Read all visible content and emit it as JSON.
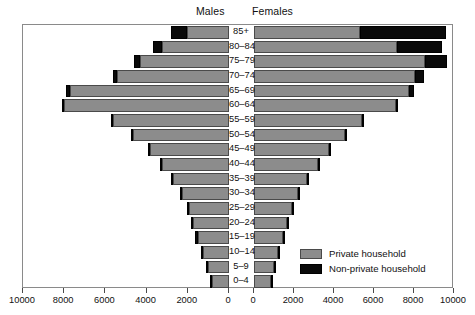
{
  "panels": {
    "left_label": "Males",
    "right_label": "Females"
  },
  "legend": {
    "items": [
      {
        "label": "Private household",
        "color": "#8c8c8c",
        "key": "private"
      },
      {
        "label": "Non-private household",
        "color": "#0a0a0a",
        "key": "nonprivate"
      }
    ]
  },
  "axis": {
    "tick_labels_left": [
      "10000",
      "8000",
      "6000",
      "4000",
      "2000",
      "0"
    ],
    "tick_labels_right": [
      "0",
      "2000",
      "4000",
      "6000",
      "8000",
      "10000"
    ],
    "tick_values": [
      0,
      2000,
      4000,
      6000,
      8000,
      10000
    ],
    "max": 10000
  },
  "chart_data": {
    "type": "bar",
    "subtype": "population-pyramid",
    "title": "",
    "xlabel": "",
    "ylabel": "",
    "xlim": [
      0,
      10000
    ],
    "grid": false,
    "legend_position": "bottom-right",
    "orientation": "horizontal",
    "stacked": true,
    "categories": [
      "85+",
      "80–84",
      "75–79",
      "70–74",
      "65–69",
      "60–64",
      "55–59",
      "50–54",
      "45–49",
      "40–44",
      "35–39",
      "30–34",
      "25–29",
      "20–24",
      "15–19",
      "10–14",
      "5–9",
      "0–4"
    ],
    "series": [
      {
        "name": "Males - Private household",
        "side": "left",
        "stack_key": "private",
        "color": "#8c8c8c",
        "values": [
          2050,
          3250,
          4300,
          5450,
          7700,
          8000,
          5650,
          4700,
          3850,
          3300,
          2750,
          2300,
          2000,
          1750,
          1500,
          1300,
          1100,
          900
        ]
      },
      {
        "name": "Males - Non-private household",
        "side": "left",
        "stack_key": "nonprivate",
        "color": "#0a0a0a",
        "values": [
          750,
          450,
          300,
          200,
          220,
          120,
          90,
          80,
          70,
          70,
          60,
          60,
          60,
          90,
          170,
          60,
          40,
          30
        ]
      },
      {
        "name": "Females - Private household",
        "side": "right",
        "stack_key": "private",
        "color": "#8c8c8c",
        "values": [
          5300,
          7150,
          8550,
          8050,
          7750,
          7100,
          5400,
          4550,
          3800,
          3250,
          2700,
          2250,
          1950,
          1700,
          1450,
          1250,
          1050,
          900
        ]
      },
      {
        "name": "Females - Non-private household",
        "side": "right",
        "stack_key": "nonprivate",
        "color": "#0a0a0a",
        "values": [
          4300,
          2250,
          1100,
          450,
          250,
          120,
          90,
          80,
          70,
          70,
          60,
          60,
          60,
          70,
          90,
          50,
          40,
          30
        ]
      }
    ]
  }
}
